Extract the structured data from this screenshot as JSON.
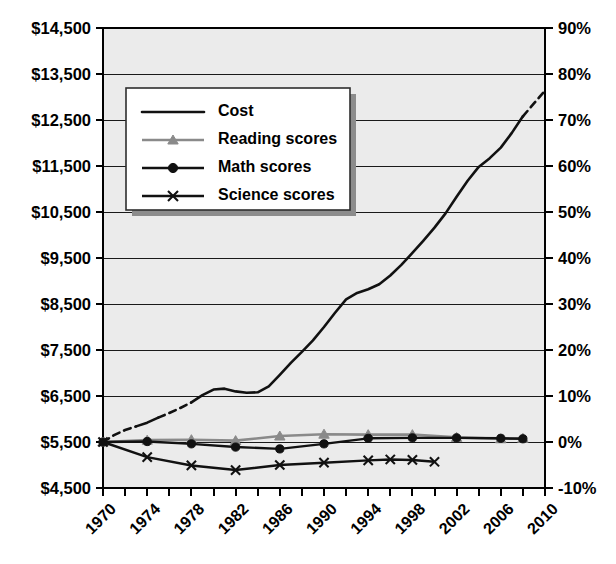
{
  "chart_data": {
    "type": "line",
    "title": "",
    "subtitle": "",
    "xlabel": "",
    "ylabel": "",
    "y2label": "",
    "grid": true,
    "legend_position": "upper-left-inside",
    "x": [
      1970,
      1972,
      1974,
      1976,
      1978,
      1980,
      1982,
      1984,
      1986,
      1988,
      1990,
      1992,
      1994,
      1996,
      1998,
      2000,
      2002,
      2004,
      2006,
      2008,
      2010
    ],
    "xtick_labels": [
      "1970",
      "1974",
      "1978",
      "1982",
      "1986",
      "1990",
      "1994",
      "1998",
      "2002",
      "2006",
      "2010"
    ],
    "xtick_values": [
      1970,
      1974,
      1978,
      1982,
      1986,
      1990,
      1994,
      1998,
      2002,
      2006,
      2010
    ],
    "xlim": [
      1970,
      2010
    ],
    "xtick_interval_minor": 2,
    "xtick_interval_major": 4,
    "xtick_label_rotation_deg": 45,
    "axis_left": {
      "tick_labels": [
        "$14,500",
        "$13,500",
        "$12,500",
        "$11,500",
        "$10,500",
        "$9,500",
        "$8,500",
        "$7,500",
        "$6,500",
        "$5,500",
        "$4,500"
      ],
      "tick_values": [
        14500,
        13500,
        12500,
        11500,
        10500,
        9500,
        8500,
        7500,
        6500,
        5500,
        4500
      ],
      "ylim": [
        4500,
        14500
      ],
      "prefix": "$",
      "step": 1000
    },
    "axis_right": {
      "tick_labels": [
        "90%",
        "80%",
        "70%",
        "60%",
        "50%",
        "40%",
        "30%",
        "20%",
        "10%",
        "0%",
        "-10%"
      ],
      "tick_values": [
        90,
        80,
        70,
        60,
        50,
        40,
        30,
        20,
        10,
        0,
        -10
      ],
      "ylim": [
        -10,
        90
      ],
      "suffix": "%",
      "step": 10
    },
    "series": [
      {
        "name": "Cost",
        "legend_label": "Cost",
        "color": "#111111",
        "marker": "none",
        "axis": "right",
        "units": "percent change",
        "x": [
          1970,
          1971,
          1972,
          1973,
          1974,
          1975,
          1976,
          1977,
          1978,
          1979,
          1980,
          1981,
          1982,
          1983,
          1984,
          1985,
          1986,
          1987,
          1988,
          1989,
          1990,
          1991,
          1992,
          1993,
          1994,
          1995,
          1996,
          1997,
          1998,
          1999,
          2000,
          2001,
          2002,
          2003,
          2004,
          2005,
          2006,
          2007,
          2008,
          2009,
          2010
        ],
        "values": [
          0,
          1.5,
          2.6,
          3.4,
          4.2,
          5.3,
          6.3,
          7.4,
          8.6,
          10.2,
          11.4,
          11.6,
          11.0,
          10.7,
          10.8,
          12.1,
          14.6,
          17.2,
          19.6,
          22.1,
          25.0,
          28.1,
          31.0,
          32.4,
          33.2,
          34.3,
          36.2,
          38.5,
          41.1,
          43.8,
          46.6,
          49.7,
          53.3,
          56.8,
          59.8,
          61.7,
          64.0,
          67.2,
          70.8,
          73.6,
          76.4
        ],
        "dashed_segments": [
          [
            1970,
            1973
          ],
          [
            1975,
            1978
          ],
          [
            2008,
            2010
          ]
        ],
        "end_year": 2010
      },
      {
        "name": "Reading scores",
        "legend_label": "Reading scores",
        "color": "#8a8a8a",
        "marker": "triangle",
        "axis": "right",
        "units": "percent change",
        "x": [
          1970,
          1974,
          1978,
          1982,
          1986,
          1990,
          1994,
          1998,
          2002,
          2006,
          2008
        ],
        "values": [
          0,
          0.4,
          0.5,
          0.3,
          1.3,
          1.7,
          1.6,
          1.6,
          1.0,
          0.7,
          0.8
        ],
        "end_year": 2008
      },
      {
        "name": "Math scores",
        "legend_label": "Math scores",
        "color": "#111111",
        "marker": "circle",
        "axis": "right",
        "units": "percent change",
        "x": [
          1970,
          1974,
          1978,
          1982,
          1986,
          1990,
          1994,
          1998,
          2002,
          2006,
          2008
        ],
        "values": [
          0,
          0.1,
          -0.4,
          -1.1,
          -1.5,
          -0.4,
          0.8,
          0.9,
          0.9,
          0.8,
          0.7
        ],
        "end_year": 2008
      },
      {
        "name": "Science scores",
        "legend_label": "Science scores",
        "color": "#111111",
        "marker": "x",
        "axis": "right",
        "units": "percent change",
        "x": [
          1970,
          1974,
          1978,
          1982,
          1986,
          1990,
          1994,
          1996,
          1998,
          2000
        ],
        "values": [
          0,
          -3.3,
          -5.1,
          -6.1,
          -5.0,
          -4.5,
          -4.0,
          -3.8,
          -3.9,
          -4.3
        ],
        "end_year": 2000
      }
    ],
    "legend_entries": [
      "Cost",
      "Reading scores",
      "Math scores",
      "Science scores"
    ],
    "colors": {
      "plot_background": "#ebebeb",
      "gridline": "#1a1a1a",
      "axis": "#000000",
      "cost": "#111111",
      "reading": "#8a8a8a",
      "math": "#111111",
      "science": "#111111",
      "legend_background": "#ffffff",
      "legend_shadow": "#8c8c8c"
    }
  }
}
